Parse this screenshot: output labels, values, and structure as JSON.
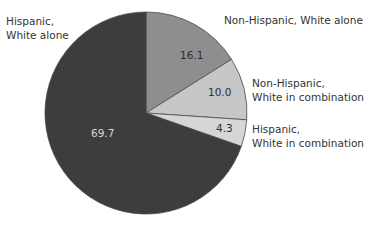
{
  "chart_data": {
    "type": "pie",
    "title": "",
    "start_angle": "12 o'clock",
    "direction": "clockwise",
    "unit": "percent",
    "slices": [
      {
        "name": "Non-Hispanic, White alone",
        "value": 16.1,
        "color": "#8e8e8e",
        "label_color": "#2e2e2e"
      },
      {
        "name": "Non-Hispanic, White in combination",
        "value": 10.0,
        "color": "#c6c6c6",
        "label_color": "#2e2e2e"
      },
      {
        "name": "Hispanic, White in combination",
        "value": 4.3,
        "color": "#d6d6d6",
        "label_color": "#2e2e2e"
      },
      {
        "name": "Hispanic, White alone",
        "value": 69.7,
        "color": "#3d3d3d",
        "label_color": "#d8d8d8"
      }
    ]
  },
  "labels": {
    "hispanic_white_alone": [
      "Hispanic,",
      "White alone"
    ],
    "nonhispanic_white_alone": [
      "Non-Hispanic, White alone"
    ],
    "nonhispanic_white_combo": [
      "Non-Hispanic,",
      "White in combination"
    ],
    "hispanic_white_combo": [
      "Hispanic,",
      "White in combination"
    ]
  },
  "values": {
    "nonhispanic_white_alone": "16.1",
    "nonhispanic_white_combo": "10.0",
    "hispanic_white_combo": "4.3",
    "hispanic_white_alone": "69.7"
  }
}
